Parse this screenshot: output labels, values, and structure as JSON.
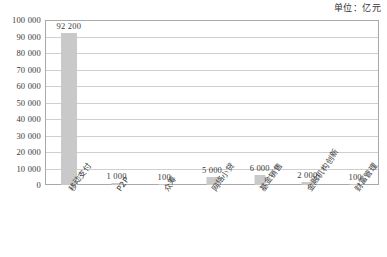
{
  "unit_note": "单位：亿元",
  "chart_data": {
    "type": "bar",
    "title": "",
    "subtitle": "",
    "xlabel": "",
    "ylabel": "",
    "unit_annotation": "单位：亿元",
    "ylim": [
      0,
      100000
    ],
    "ytick_step": 10000,
    "grid": true,
    "legend": "none",
    "bar_color": "#c9c9c9",
    "axis_color": "#a9a9a9",
    "gridline_color": "#cfcfcf",
    "yticks": [
      "100 000",
      "90 000",
      "80 000",
      "70 000",
      "60 000",
      "50 000",
      "40 000",
      "30 000",
      "20 000",
      "10 000",
      "0"
    ],
    "ytick_values": [
      100000,
      90000,
      80000,
      70000,
      60000,
      50000,
      40000,
      30000,
      20000,
      10000,
      0
    ],
    "categories": [
      "移动支付",
      "P2P",
      "众筹",
      "网络小贷",
      "基金销售",
      "金融机构创新",
      "财富管理"
    ],
    "values": [
      92200,
      1000,
      100,
      5000,
      6000,
      2000,
      100
    ],
    "value_labels": [
      "92 200",
      "1 000",
      "100",
      "5 000",
      "6 000",
      "2 000",
      "100"
    ]
  }
}
